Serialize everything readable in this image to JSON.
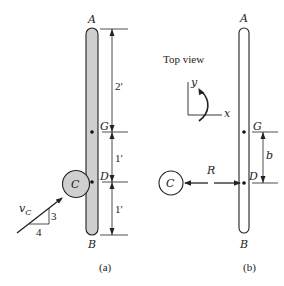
{
  "figure_a": {
    "caption": "(a)",
    "points": {
      "A": "A",
      "G": "G",
      "D": "D",
      "B": "B"
    },
    "disk_label": "C",
    "dimensions": [
      "2′",
      "1′",
      "1′"
    ],
    "velocity_label": "v",
    "velocity_subscript": "C",
    "slope_triangle": {
      "run": "4",
      "rise": "3"
    },
    "colors": {
      "bar_fill": "#cfcfcf",
      "disk_fill": "#cfcfcf",
      "stroke": "#222222"
    }
  },
  "figure_b": {
    "caption": "(b)",
    "view_label": "Top view",
    "axes": {
      "x": "x",
      "y": "y"
    },
    "points": {
      "A": "A",
      "G": "G",
      "D": "D",
      "B": "B"
    },
    "disk_label": "C",
    "force_label": "R",
    "dimension": "b",
    "colors": {
      "bar_fill": "#ffffff",
      "disk_fill": "#ffffff",
      "stroke": "#222222"
    }
  }
}
